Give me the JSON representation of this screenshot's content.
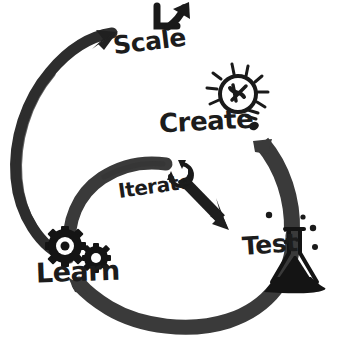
{
  "diagram": {
    "style": "hand-drawn marker sketch",
    "background_color": "#ffffff",
    "ink_color": "#252525",
    "stroke_color": "#2d2d2d"
  },
  "nodes": [
    {
      "id": "scale",
      "label": "Scale",
      "icon": "growth-arrow-icon",
      "icon_description": "L-shaped axis with upward trending arrow",
      "position": "top"
    },
    {
      "id": "create",
      "label": "Create",
      "icon": "lightbulb-icon",
      "icon_description": "lightbulb with radiating rays",
      "position": "top-right"
    },
    {
      "id": "test",
      "label": "Test",
      "icon": "flask-icon",
      "icon_description": "erlenmeyer flask with liquid and bubbles",
      "position": "bottom-right"
    },
    {
      "id": "learn",
      "label": "Learn",
      "icon": "gears-icon",
      "icon_description": "two interlocking cogwheels",
      "position": "bottom-left"
    },
    {
      "id": "iterate",
      "label": "Iterate",
      "icon": "refresh-loop-icon",
      "icon_description": "circular recycling arrows",
      "position": "center"
    }
  ],
  "connectors": [
    {
      "id": "learn-to-scale",
      "from": "learn",
      "to": "scale",
      "shape": "large-outer-arc",
      "arrowhead": true
    },
    {
      "id": "learn-to-iterate",
      "from": "learn",
      "to": "iterate",
      "shape": "inner-arc",
      "arrowhead": false
    },
    {
      "id": "iterate-to-test",
      "from": "iterate",
      "to": "test",
      "shape": "straight-diagonal",
      "arrowhead": true
    },
    {
      "id": "create-to-test",
      "from": "create",
      "to": "test",
      "shape": "right-arc",
      "arrowhead": false
    },
    {
      "id": "test-to-learn",
      "from": "test",
      "to": "learn",
      "shape": "bottom-arc",
      "arrowhead": false
    }
  ]
}
